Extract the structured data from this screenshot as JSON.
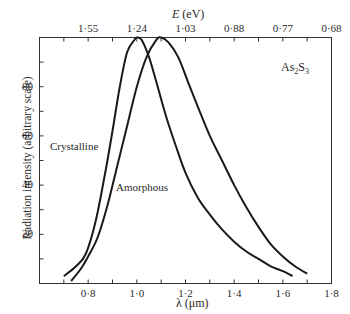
{
  "chart_data": {
    "type": "line",
    "title": "",
    "annotation": "As2S3",
    "xlabel": "λ (μm)",
    "ylabel": "Radiation intensity (arbitrary scale)",
    "x2label": "E (eV)",
    "xlim": [
      0.6,
      1.8
    ],
    "ylim": [
      0,
      100
    ],
    "xticks": [
      0.8,
      1.0,
      1.2,
      1.4,
      1.6,
      1.8
    ],
    "xtick_labels": [
      "0·8",
      "1·0",
      "1·2",
      "1·4",
      "1·6",
      "1·8"
    ],
    "yticks": [
      20,
      40,
      60,
      80
    ],
    "ytick_labels": [
      "20",
      "40",
      "60",
      "80"
    ],
    "x2ticks_lambda": [
      0.8,
      1.0,
      1.2,
      1.4,
      1.6,
      1.8
    ],
    "x2tick_labels": [
      "1·55",
      "1·24",
      "1·03",
      "0·88",
      "0·77",
      "0·68"
    ],
    "grid": false,
    "legend": "inline labels",
    "series": [
      {
        "name": "Crystalline",
        "x": [
          0.7,
          0.75,
          0.79,
          0.83,
          0.87,
          0.9,
          0.93,
          0.96,
          0.99,
          1.0,
          1.02,
          1.05,
          1.08,
          1.12,
          1.16,
          1.2,
          1.25,
          1.3,
          1.35,
          1.4,
          1.45,
          1.5,
          1.55,
          1.6,
          1.64
        ],
        "values": [
          3,
          7,
          12,
          25,
          45,
          62,
          80,
          94,
          99,
          100,
          99,
          92,
          82,
          68,
          56,
          45,
          35,
          28,
          22,
          17,
          13,
          10,
          7,
          5,
          3
        ]
      },
      {
        "name": "Amorphous",
        "x": [
          0.73,
          0.77,
          0.8,
          0.84,
          0.88,
          0.92,
          0.96,
          1.0,
          1.04,
          1.08,
          1.1,
          1.13,
          1.17,
          1.21,
          1.25,
          1.3,
          1.35,
          1.4,
          1.45,
          1.5,
          1.55,
          1.6,
          1.65,
          1.7
        ],
        "values": [
          1,
          6,
          11,
          19,
          32,
          48,
          64,
          80,
          92,
          99,
          100,
          98,
          92,
          82,
          72,
          60,
          50,
          40,
          31,
          23,
          16,
          11,
          7,
          4
        ]
      }
    ],
    "labels": {
      "crystalline": "Crystalline",
      "amorphous": "Amorphous",
      "compound": "As₂S₃"
    }
  }
}
